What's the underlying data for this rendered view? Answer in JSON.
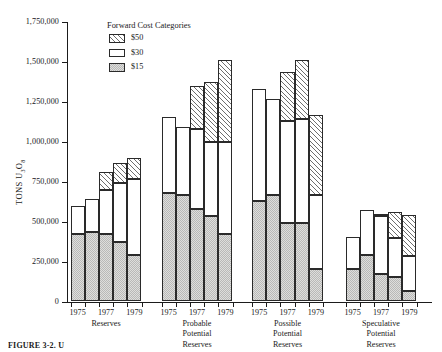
{
  "chart_data": {
    "type": "bar",
    "subtype": "stacked-grouped",
    "title": "",
    "xlabel": "",
    "ylabel": "TONS U3O8",
    "ylabel_parts": {
      "prefix": "TONS U",
      "sub1": "3",
      "mid": "O",
      "sub2": "8"
    },
    "ylim": [
      0,
      1750000
    ],
    "ytick_values": [
      0,
      250000,
      500000,
      750000,
      1000000,
      1250000,
      1500000,
      1750000
    ],
    "ytick_labels": [
      "0",
      "250,000",
      "500,000",
      "750,000",
      "1,000,000",
      "1,250,000",
      "1,500,000",
      "1,750,000"
    ],
    "grid": false,
    "legend": {
      "title": "Forward Cost Categories",
      "position": "inside-top-left",
      "entries": [
        {
          "label": "$50",
          "pattern": "diagonal-hatch",
          "color": "#ffffff"
        },
        {
          "label": "$30",
          "pattern": "solid-white",
          "color": "#ffffff"
        },
        {
          "label": "$15",
          "pattern": "light-stipple",
          "color": "#dededc"
        }
      ]
    },
    "series": [
      {
        "name": "$15",
        "key": "s15"
      },
      {
        "name": "$30",
        "key": "s30"
      },
      {
        "name": "$50",
        "key": "s50"
      }
    ],
    "groups": [
      {
        "name": "Reserves",
        "label_lines": [
          "Reserves"
        ],
        "categories": [
          "1975",
          "1976",
          "1977",
          "1978",
          "1979"
        ],
        "tick_labels": [
          "1975",
          "",
          "1977",
          "",
          "1979"
        ],
        "bars": [
          {
            "category": "1975",
            "s15": 420000,
            "s30": 180000,
            "s50": 0,
            "total": 600000
          },
          {
            "category": "1976",
            "s15": 435000,
            "s30": 205000,
            "s50": 0,
            "total": 640000
          },
          {
            "category": "1977",
            "s15": 420000,
            "s30": 280000,
            "s50": 110000,
            "total": 810000
          },
          {
            "category": "1978",
            "s15": 370000,
            "s30": 370000,
            "s50": 130000,
            "total": 870000
          },
          {
            "category": "1979",
            "s15": 290000,
            "s30": 475000,
            "s50": 135000,
            "total": 900000
          }
        ]
      },
      {
        "name": "Probable Potential Reserves",
        "label_lines": [
          "Probable",
          "Potential",
          "Reserves"
        ],
        "categories": [
          "1975",
          "1976",
          "1977",
          "1978",
          "1979"
        ],
        "tick_labels": [
          "1975",
          "",
          "1977",
          "",
          "1979"
        ],
        "bars": [
          {
            "category": "1975",
            "s15": 680000,
            "s30": 475000,
            "s50": 0,
            "total": 1155000
          },
          {
            "category": "1976",
            "s15": 665000,
            "s30": 425000,
            "s50": 0,
            "total": 1090000
          },
          {
            "category": "1977",
            "s15": 580000,
            "s30": 500000,
            "s50": 270000,
            "total": 1350000
          },
          {
            "category": "1978",
            "s15": 535000,
            "s30": 465000,
            "s50": 375000,
            "total": 1375000
          },
          {
            "category": "1979",
            "s15": 420000,
            "s30": 580000,
            "s50": 510000,
            "total": 1510000
          }
        ]
      },
      {
        "name": "Possible Potential Reserves",
        "label_lines": [
          "Possible",
          "Potential",
          "Reserves"
        ],
        "categories": [
          "1975",
          "1976",
          "1977",
          "1978",
          "1979"
        ],
        "tick_labels": [
          "1975",
          "",
          "1977",
          "",
          "1979"
        ],
        "bars": [
          {
            "category": "1975",
            "s15": 630000,
            "s30": 700000,
            "s50": 0,
            "total": 1330000
          },
          {
            "category": "1976",
            "s15": 665000,
            "s30": 600000,
            "s50": 0,
            "total": 1265000
          },
          {
            "category": "1977",
            "s15": 490000,
            "s30": 640000,
            "s50": 305000,
            "total": 1435000
          },
          {
            "category": "1978",
            "s15": 490000,
            "s30": 650000,
            "s50": 370000,
            "total": 1510000
          },
          {
            "category": "1979",
            "s15": 205000,
            "s30": 460000,
            "s50": 500000,
            "total": 1165000
          }
        ]
      },
      {
        "name": "Speculative Potential Reserves",
        "label_lines": [
          "Speculative",
          "Potential",
          "Reserves"
        ],
        "categories": [
          "1975",
          "1976",
          "1977",
          "1978",
          "1979"
        ],
        "tick_labels": [
          "1975",
          "",
          "1977",
          "",
          "1979"
        ],
        "bars": [
          {
            "category": "1975",
            "s15": 205000,
            "s30": 200000,
            "s50": 0,
            "total": 405000
          },
          {
            "category": "1976",
            "s15": 290000,
            "s30": 285000,
            "s50": 0,
            "total": 575000
          },
          {
            "category": "1977",
            "s15": 175000,
            "s30": 360000,
            "s50": 15000,
            "total": 550000
          },
          {
            "category": "1978",
            "s15": 155000,
            "s30": 245000,
            "s50": 160000,
            "total": 560000
          },
          {
            "category": "1979",
            "s15": 65000,
            "s30": 220000,
            "s50": 255000,
            "total": 540000
          }
        ]
      }
    ]
  },
  "caption": {
    "text": "FIGURE 3-2. U"
  }
}
